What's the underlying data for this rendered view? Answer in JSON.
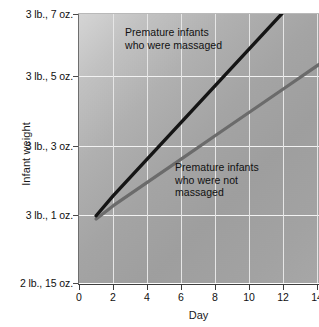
{
  "chart_data": {
    "type": "line",
    "title": "",
    "xlabel": "Day",
    "ylabel": "Infant weight",
    "xlim": [
      0,
      14
    ],
    "x_ticks": [
      0,
      2,
      4,
      6,
      8,
      10,
      12,
      14
    ],
    "x_tick_labels": [
      "0",
      "2",
      "4",
      "6",
      "8",
      "10",
      "12",
      "14"
    ],
    "y_tick_labels": [
      "3 lb., 7 oz.",
      "3 lb., 5 oz.",
      "3 lb., 3 oz.",
      "3 lb., 1 oz.",
      "2 lb., 15 oz."
    ],
    "y_tick_values_oz": [
      55,
      53,
      51,
      49,
      47
    ],
    "ylim_oz": [
      47,
      55
    ],
    "grid": true,
    "legend_position": "inline-annotations",
    "series": [
      {
        "name": "Premature infants who were massaged",
        "label_text": "Premature infants\nwho were massaged",
        "color": "#151515",
        "x": [
          1,
          2,
          4,
          6,
          8,
          10,
          12,
          14
        ],
        "y_oz": [
          49.0,
          49.6,
          50.7,
          51.8,
          52.9,
          54.0,
          55.1,
          56.2
        ]
      },
      {
        "name": "Premature infants who were not massaged",
        "label_text": "Premature infants\nwho were not\nmassaged",
        "color": "#6b6b6b",
        "x": [
          1,
          2,
          4,
          6,
          8,
          10,
          12,
          14
        ],
        "y_oz": [
          48.9,
          49.3,
          50.0,
          50.7,
          51.4,
          52.1,
          52.8,
          53.5
        ]
      }
    ],
    "colors": {
      "massaged_line": "#151515",
      "not_massaged_line": "#6b6b6b",
      "plot_background": "#a8a8a8",
      "gridline": "#f2f2f2",
      "text": "#111111"
    }
  },
  "axes": {
    "y_title": "Infant weight",
    "x_title": "Day",
    "y_ticks": [
      {
        "label": "3 lb., 7 oz.",
        "top": 14
      },
      {
        "label": "3 lb., 5 oz.",
        "top": 76
      },
      {
        "label": "3 lb., 3 oz.",
        "top": 146
      },
      {
        "label": "3 lb., 1 oz.",
        "top": 215
      },
      {
        "label": "2 lb., 15 oz.",
        "top": 283
      }
    ],
    "x_ticks": [
      {
        "label": "0",
        "left": 79
      },
      {
        "label": "2",
        "left": 113
      },
      {
        "label": "4",
        "left": 147
      },
      {
        "label": "6",
        "left": 181
      },
      {
        "label": "8",
        "left": 215
      },
      {
        "label": "10",
        "left": 249
      },
      {
        "label": "12",
        "left": 283
      },
      {
        "label": "14",
        "left": 317
      }
    ]
  },
  "annotations": {
    "massaged": "Premature infants\nwho were massaged",
    "not_massaged": "Premature infants\nwho were not\nmassaged"
  }
}
